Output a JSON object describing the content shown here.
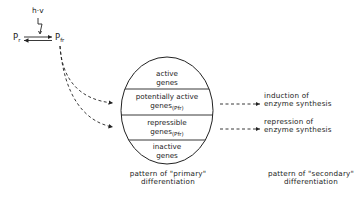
{
  "light": {
    "label": "h·v",
    "pr": {
      "base": "P",
      "sub": "r"
    },
    "pfr": {
      "base": "P",
      "sub": "fr"
    }
  },
  "circle": {
    "zones": [
      {
        "line1": "active",
        "line2": "genes",
        "tag": ""
      },
      {
        "line1": "potentially active",
        "line2": "genes",
        "tag": "(Pfr)"
      },
      {
        "line1": "repressible",
        "line2": "genes",
        "tag": "(Pfr)"
      },
      {
        "line1": "inactive",
        "line2": "genes",
        "tag": ""
      }
    ]
  },
  "outcomes": {
    "induction": {
      "line1": "induction of",
      "line2": "enzyme synthesis"
    },
    "repression": {
      "line1": "repression of",
      "line2": "enzyme synthesis"
    }
  },
  "captions": {
    "primary": {
      "line1": "pattern of \"primary\"",
      "line2": "differentiation"
    },
    "secondary": {
      "line1": "pattern of \"secondary\"",
      "line2": "differentiation"
    }
  },
  "colors": {
    "ink": "#222222",
    "background": "#ffffff"
  }
}
